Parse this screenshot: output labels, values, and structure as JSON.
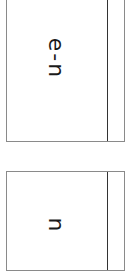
{
  "tabs": [
    {
      "label": "e-n"
    },
    {
      "label": "n"
    }
  ],
  "colors": {
    "border": "#8a8a8a",
    "divider": "#333333",
    "text": "#1a1a1a",
    "background": "#ffffff"
  }
}
